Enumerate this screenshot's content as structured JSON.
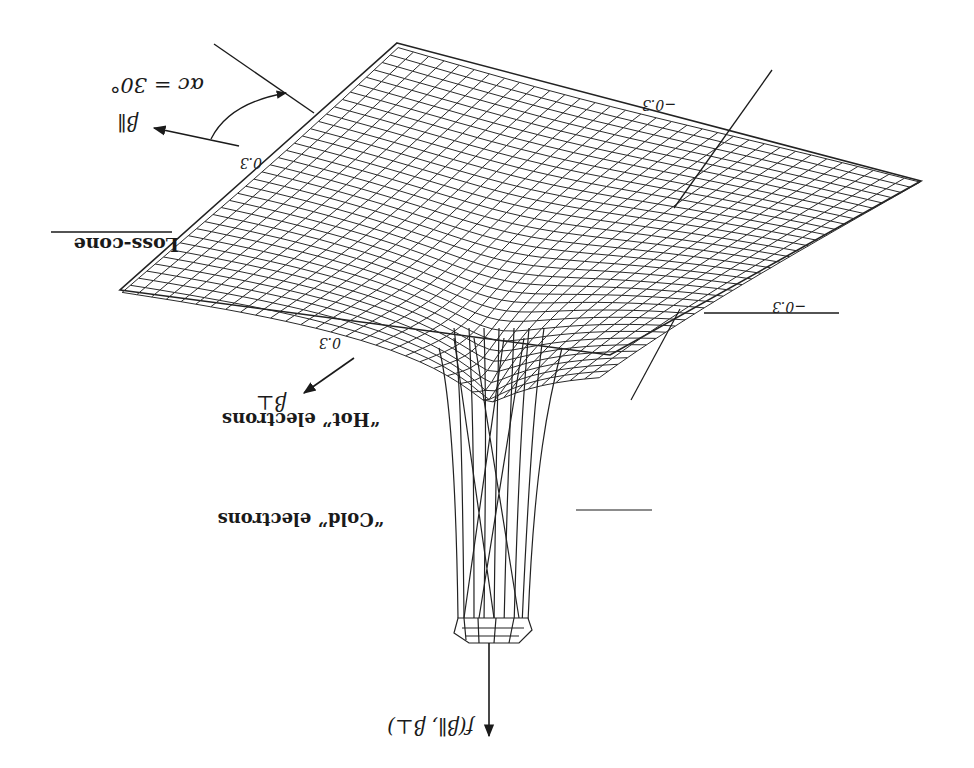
{
  "figure": {
    "orientation": "rotated 180 degrees",
    "surface_color": "#222222",
    "background": "#ffffff"
  },
  "labels": {
    "z_axis": "f(β∥, β⊥)",
    "x_axis": "β∥",
    "y_axis": "β⊥",
    "loss_cone": "Loss-cone",
    "angle": "αc = 30°",
    "hot": "“Hot” electrons",
    "cold": "“Cold” electrons",
    "tick_par_pos": "0.3",
    "tick_perp_pos": "0.3",
    "tick_par_neg": "−0.3",
    "tick_perp_neg": "−0.3"
  }
}
